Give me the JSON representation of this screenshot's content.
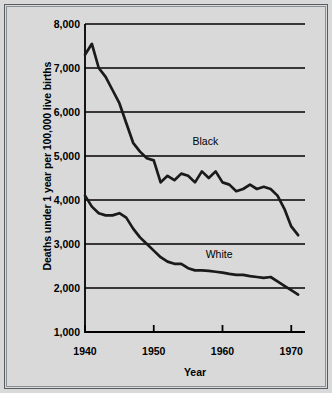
{
  "chart_data": {
    "type": "line",
    "title": "",
    "xlabel": "Year",
    "ylabel": "Deaths under 1 year per 100,000 live births",
    "xlim": [
      1940,
      1972
    ],
    "ylim": [
      1000,
      8000
    ],
    "grid": true,
    "grid_axis": "y",
    "legend": "inline-annotations",
    "xticks": [
      1940,
      1950,
      1960,
      1970
    ],
    "xtick_labels": [
      "1940",
      "1950",
      "1960",
      "1970"
    ],
    "yticks": [
      1000,
      2000,
      3000,
      4000,
      5000,
      6000,
      7000,
      8000
    ],
    "ytick_labels": [
      "1,000",
      "2,000",
      "3,000",
      "4,000",
      "5,000",
      "6,000",
      "7,000",
      "8,000"
    ],
    "x": [
      1940,
      1941,
      1942,
      1943,
      1944,
      1945,
      1946,
      1947,
      1948,
      1949,
      1950,
      1951,
      1952,
      1953,
      1954,
      1955,
      1956,
      1957,
      1958,
      1959,
      1960,
      1961,
      1962,
      1963,
      1964,
      1965,
      1966,
      1967,
      1968,
      1969,
      1970,
      1971
    ],
    "series": [
      {
        "name": "Black",
        "color": "#1a1a1a",
        "annotation": {
          "text": "Black",
          "x": 1957.5,
          "y": 5350
        },
        "values": [
          7300,
          7550,
          7000,
          6800,
          6500,
          6200,
          5750,
          5300,
          5100,
          4950,
          4900,
          4400,
          4550,
          4450,
          4600,
          4550,
          4400,
          4650,
          4500,
          4650,
          4400,
          4350,
          4200,
          4250,
          4350,
          4250,
          4300,
          4250,
          4100,
          3800,
          3400,
          3200
        ]
      },
      {
        "name": "White",
        "color": "#1a1a1a",
        "annotation": {
          "text": "White",
          "x": 1959.5,
          "y": 2780
        },
        "values": [
          4100,
          3850,
          3700,
          3650,
          3650,
          3700,
          3600,
          3350,
          3150,
          3000,
          2850,
          2700,
          2600,
          2550,
          2550,
          2450,
          2400,
          2400,
          2390,
          2370,
          2350,
          2320,
          2300,
          2300,
          2270,
          2250,
          2230,
          2250,
          2150,
          2050,
          1950,
          1850
        ]
      }
    ]
  },
  "labels": {
    "black_series": "Black",
    "white_series": "White",
    "x_axis_title": "Year",
    "y_axis_title": "Deaths under 1 year per 100,000 live births"
  },
  "colors": {
    "background": "#d9d9d9",
    "line": "#1a1a1a",
    "axis": "#000000",
    "border": "#555d63"
  }
}
